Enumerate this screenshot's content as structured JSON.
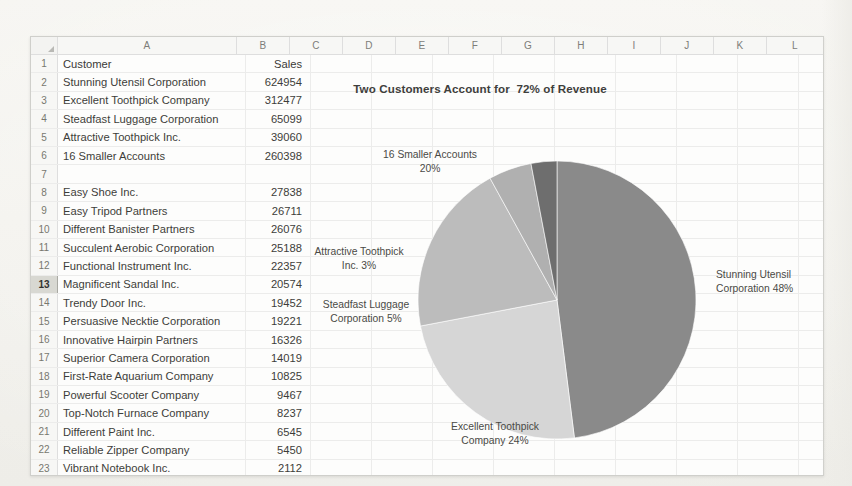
{
  "app": {
    "type": "spreadsheet",
    "row_header_icon": "select-all-triangle-icon",
    "selected_row": 13
  },
  "grid": {
    "columns": [
      "A",
      "B",
      "C",
      "D",
      "E",
      "F",
      "G",
      "H",
      "I",
      "J",
      "K",
      "L"
    ],
    "row_numbers": [
      1,
      2,
      3,
      4,
      5,
      6,
      7,
      8,
      9,
      10,
      11,
      12,
      13,
      14,
      15,
      16,
      17,
      18,
      19,
      20,
      21,
      22,
      23
    ],
    "header_row": {
      "customer": "Customer",
      "sales": "Sales"
    },
    "rows": [
      {
        "n": 1,
        "customer": "Customer",
        "sales": "Sales"
      },
      {
        "n": 2,
        "customer": "Stunning Utensil Corporation",
        "sales": "624954"
      },
      {
        "n": 3,
        "customer": "Excellent Toothpick Company",
        "sales": "312477"
      },
      {
        "n": 4,
        "customer": "Steadfast Luggage Corporation",
        "sales": "65099"
      },
      {
        "n": 5,
        "customer": "Attractive Toothpick Inc.",
        "sales": "39060"
      },
      {
        "n": 6,
        "customer": "16 Smaller Accounts",
        "sales": "260398"
      },
      {
        "n": 7,
        "customer": "",
        "sales": ""
      },
      {
        "n": 8,
        "customer": "Easy Shoe Inc.",
        "sales": "27838"
      },
      {
        "n": 9,
        "customer": "Easy Tripod Partners",
        "sales": "26711"
      },
      {
        "n": 10,
        "customer": "Different Banister Partners",
        "sales": "26076"
      },
      {
        "n": 11,
        "customer": "Succulent Aerobic Corporation",
        "sales": "25188"
      },
      {
        "n": 12,
        "customer": "Functional Instrument Inc.",
        "sales": "22357"
      },
      {
        "n": 13,
        "customer": "Magnificent Sandal Inc.",
        "sales": "20574"
      },
      {
        "n": 14,
        "customer": "Trendy Door Inc.",
        "sales": "19452"
      },
      {
        "n": 15,
        "customer": "Persuasive Necktie Corporation",
        "sales": "19221"
      },
      {
        "n": 16,
        "customer": "Innovative Hairpin Partners",
        "sales": "16326"
      },
      {
        "n": 17,
        "customer": "Superior Camera Corporation",
        "sales": "14019"
      },
      {
        "n": 18,
        "customer": "First-Rate Aquarium Company",
        "sales": "10825"
      },
      {
        "n": 19,
        "customer": "Powerful Scooter Company",
        "sales": "9467"
      },
      {
        "n": 20,
        "customer": "Top-Notch Furnace Company",
        "sales": "8237"
      },
      {
        "n": 21,
        "customer": "Different Paint Inc.",
        "sales": "6545"
      },
      {
        "n": 22,
        "customer": "Reliable Zipper Company",
        "sales": "5450"
      },
      {
        "n": 23,
        "customer": "Vibrant Notebook Inc.",
        "sales": "2112"
      }
    ]
  },
  "chart_data": {
    "type": "pie",
    "title": "Two Customers Account for  72% of Revenue",
    "categories": [
      "Stunning Utensil Corporation",
      "Excellent Toothpick Company",
      "16 Smaller Accounts",
      "Steadfast Luggage Corporation",
      "Attractive Toothpick Inc."
    ],
    "values": [
      624954,
      312477,
      260398,
      65099,
      39060
    ],
    "percentages": [
      48,
      24,
      20,
      5,
      3
    ],
    "colors": [
      "#8a8a8a",
      "#d6d6d6",
      "#bcbcbc",
      "#b0b0b0",
      "#6e6e6e"
    ],
    "labels": [
      "Stunning Utensil\nCorporation 48%",
      "Excellent Toothpick\nCompany 24%",
      "16 Smaller Accounts\n20%",
      "Steadfast Luggage\nCorporation 5%",
      "Attractive Toothpick\nInc. 3%"
    ],
    "legend": "none",
    "data_labels": "outside-end",
    "start_angle": 0
  }
}
